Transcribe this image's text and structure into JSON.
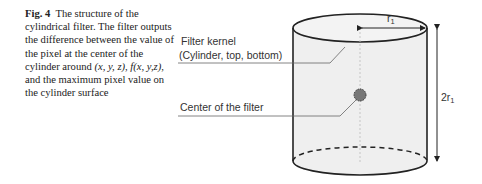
{
  "figure": {
    "label": "Fig. 4",
    "caption_parts": [
      {
        "t": "The structure of the cylindrical filter. The filter outputs the difference between the value of the pixel at the center of the cylinder around ",
        "style": "normal"
      },
      {
        "t": "(x, y, z)",
        "style": "italic"
      },
      {
        "t": ", ",
        "style": "normal"
      },
      {
        "t": "f(x, y,z)",
        "style": "italic"
      },
      {
        "t": ", and the maximum pixel value on the cylinder surface",
        "style": "normal"
      }
    ]
  },
  "diagram": {
    "label_kernel_line1": "Filter kernel",
    "label_kernel_line2": "(Cylinder, top, bottom)",
    "label_center": "Center of the filter",
    "radius_label": "r",
    "radius_sub": "1",
    "height_label": "2r",
    "height_sub": "1"
  }
}
